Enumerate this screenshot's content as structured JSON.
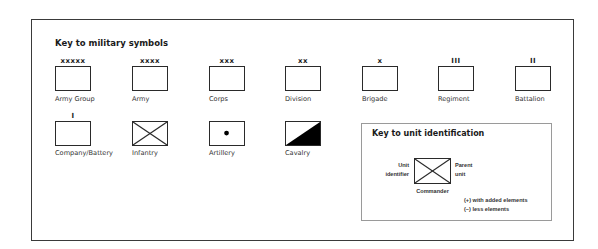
{
  "title": "Key to military symbols",
  "echelons": [
    {
      "label": "Army Group",
      "marker": "xxxxx"
    },
    {
      "label": "Army",
      "marker": "xxxx"
    },
    {
      "label": "Corps",
      "marker": "xxx"
    },
    {
      "label": "Division",
      "marker": "xx"
    },
    {
      "label": "Brigade",
      "marker": "x"
    },
    {
      "label": "Regiment",
      "marker": "III"
    },
    {
      "label": "Battalion",
      "marker": "II"
    },
    {
      "label": "Company/Battery",
      "marker": "I"
    }
  ],
  "unit_types": [
    {
      "label": "Infantry",
      "icon": "infantry-cross"
    },
    {
      "label": "Artillery",
      "icon": "artillery-dot"
    },
    {
      "label": "Cavalry",
      "icon": "cavalry-diagonal-fill"
    }
  ],
  "key_unit_identification": {
    "title": "Key to unit identification",
    "left_label_line1": "Unit",
    "left_label_line2": "identifier",
    "right_label_line1": "Parent",
    "right_label_line2": "unit",
    "bottom_label": "Commander",
    "note_plus": "(+) with added elements",
    "note_minus": "(–) less elements"
  },
  "colors": {
    "stroke": "#2a2a2a",
    "fill": "#000000",
    "frame": "#3a3a3a",
    "keybox_border": "#9a9a9a"
  }
}
